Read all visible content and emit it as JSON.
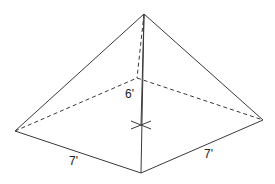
{
  "diagram": {
    "labels": {
      "height": "6'",
      "base_left_edge": "7'",
      "base_right_edge": "7'"
    },
    "dimensions": {
      "height_ft": 6,
      "base_side_ft": 7
    },
    "colors": {
      "line": "#3a3a3a",
      "text": "#222222",
      "background": "#ffffff"
    }
  }
}
